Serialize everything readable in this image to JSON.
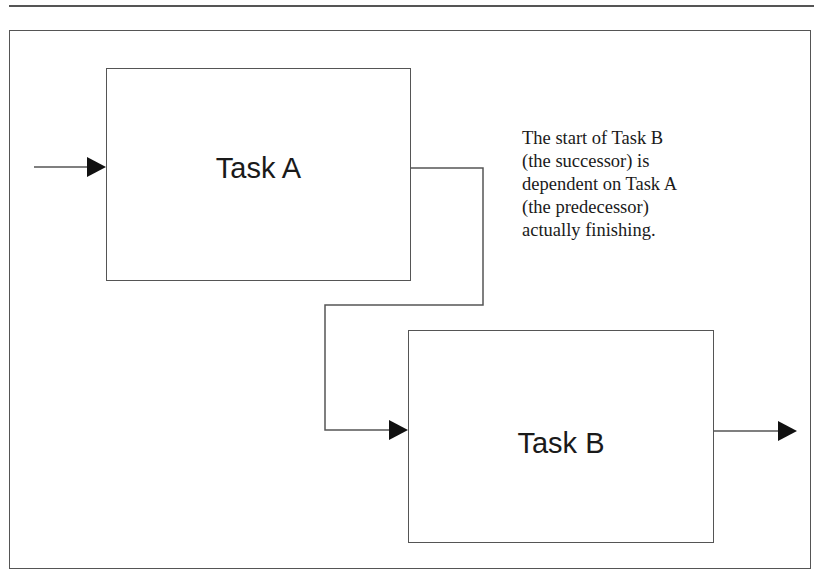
{
  "diagram": {
    "type": "finish-to-start dependency",
    "tasks": [
      {
        "id": "A",
        "label": "Task A",
        "role": "predecessor"
      },
      {
        "id": "B",
        "label": "Task B",
        "role": "successor"
      }
    ],
    "note": {
      "lines": [
        "The start of Task B",
        "(the successor) is",
        "dependent on Task A",
        "(the predecessor)",
        "actually finishing."
      ]
    },
    "connectors": [
      {
        "from": "external",
        "to": "Task A",
        "name": "input-arrow"
      },
      {
        "from": "Task A",
        "to": "Task B",
        "name": "dependency-arrow"
      },
      {
        "from": "Task B",
        "to": "external",
        "name": "output-arrow"
      }
    ],
    "colors": {
      "line": "#555555",
      "arrowhead": "#111111",
      "text": "#1a1a1a",
      "background": "#ffffff"
    }
  }
}
